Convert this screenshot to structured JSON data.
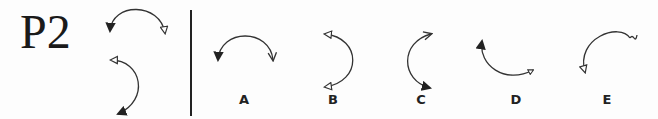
{
  "problem": {
    "id": "P2"
  },
  "stimulus": {
    "description": "Two curved double-headed arrows forming a sequence",
    "items": [
      {
        "name": "stimulus-arc-top",
        "start_head": "filled",
        "end_head": "hollow"
      },
      {
        "name": "stimulus-arc-bottom",
        "start_head": "hollow",
        "end_head": "filled"
      }
    ]
  },
  "options": [
    {
      "label": "A",
      "start_head": "filled",
      "end_head": "open-v"
    },
    {
      "label": "B",
      "start_head": "hollow",
      "end_head": "hollow"
    },
    {
      "label": "C",
      "start_head": "open-v",
      "end_head": "filled"
    },
    {
      "label": "D",
      "start_head": "filled",
      "end_head": "small-hollow"
    },
    {
      "label": "E",
      "start_head": "hollow",
      "end_head": "wavy"
    }
  ],
  "colors": {
    "stroke": "#333333",
    "background": "#fdfdfd",
    "text": "#1a1a1a"
  }
}
